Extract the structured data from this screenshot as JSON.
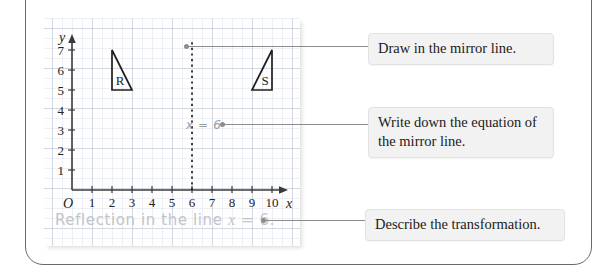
{
  "worksheet": {
    "title": "Reflection worksheet"
  },
  "graph": {
    "x_axis_label": "x",
    "y_axis_label": "y",
    "origin_label": "O",
    "x_ticks": [
      "1",
      "2",
      "3",
      "4",
      "5",
      "6",
      "7",
      "8",
      "9",
      "10"
    ],
    "y_ticks": [
      "1",
      "2",
      "3",
      "4",
      "5",
      "6",
      "7"
    ],
    "x_range": [
      0,
      10
    ],
    "y_range": [
      0,
      7
    ],
    "shapes": [
      {
        "label": "R",
        "type": "right-triangle",
        "vertices": [
          [
            2,
            5
          ],
          [
            2,
            7
          ],
          [
            3,
            5
          ]
        ]
      },
      {
        "label": "S",
        "type": "right-triangle",
        "vertices": [
          [
            10,
            5
          ],
          [
            10,
            7
          ],
          [
            9,
            5
          ]
        ]
      }
    ],
    "mirror_line": {
      "style": "dotted",
      "equation": "x = 6",
      "x_value": 6,
      "y_from": 0,
      "y_to": 7.5
    }
  },
  "answers": {
    "equation": "x = 6",
    "description_prefix": "Reflection in the line ",
    "description_var": "x",
    "description_suffix": " = 6."
  },
  "callouts": [
    {
      "text": "Draw in the mirror line."
    },
    {
      "text": "Write down the equation of the mirror line."
    },
    {
      "text": "Describe the transformation."
    }
  ],
  "colors": {
    "frame": "#6a6a6a",
    "grid_minor": "rgba(150,165,190,0.16)",
    "grid_major": "rgba(150,165,190,0.30)",
    "axis": "#3a3a3a",
    "shape_stroke": "#1f1f1f",
    "leader": "#8c8c8c",
    "callout_bg": "#f2f2f2",
    "pencil": "#c2c4ca"
  }
}
